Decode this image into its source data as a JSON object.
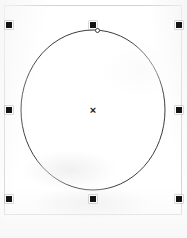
{
  "canvas": {
    "name": "drawing-canvas",
    "width": 187,
    "height": 238,
    "background_color": "#ffffff",
    "page_border_color": "#d2d2d4"
  },
  "shape": {
    "type": "ellipse",
    "label": "circle",
    "stroke_color": "#3c3c3c",
    "fill": "none",
    "stroke_width": 1,
    "center_x": 93,
    "center_y": 110,
    "radius_x": 72,
    "radius_y": 80
  },
  "selection": {
    "state": "selected",
    "handle_color": "#141414",
    "handle_size": 8,
    "handles": [
      {
        "name": "handle-top-left",
        "position": "top-left",
        "x": 9,
        "y": 25
      },
      {
        "name": "handle-top-center",
        "position": "top-center",
        "x": 93,
        "y": 25
      },
      {
        "name": "handle-top-right",
        "position": "top-right",
        "x": 179,
        "y": 25
      },
      {
        "name": "handle-middle-left",
        "position": "middle-left",
        "x": 9,
        "y": 110
      },
      {
        "name": "handle-middle-right",
        "position": "middle-right",
        "x": 179,
        "y": 110
      },
      {
        "name": "handle-bottom-left",
        "position": "bottom-left",
        "x": 9,
        "y": 199
      },
      {
        "name": "handle-bottom-center",
        "position": "bottom-center",
        "x": 93,
        "y": 199
      },
      {
        "name": "handle-bottom-right",
        "position": "bottom-right",
        "x": 179,
        "y": 199
      }
    ]
  },
  "control_point": {
    "name": "ellipse-control-point",
    "x": 97,
    "y": 30,
    "stroke_color": "#3a3a3a",
    "fill_color": "#ffffff"
  },
  "center_marker": {
    "name": "center-marker",
    "glyph": "×",
    "x": 93,
    "y": 110,
    "color": "#1b1b1b"
  },
  "caption": {
    "text": "",
    "legible": false
  }
}
